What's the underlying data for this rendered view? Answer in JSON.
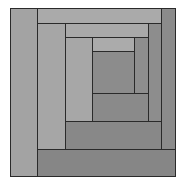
{
  "diagram": {
    "title": "",
    "type": "log-cabin-quilt-block",
    "rings": 3,
    "patches": [
      {
        "id": "ring1-left",
        "ring": 1,
        "side": "left",
        "color": "#a3a3a3"
      },
      {
        "id": "ring1-top",
        "ring": 1,
        "side": "top",
        "color": "#aaaaaa"
      },
      {
        "id": "ring1-right",
        "ring": 1,
        "side": "right",
        "color": "#8b8b8b"
      },
      {
        "id": "ring1-bottom",
        "ring": 1,
        "side": "bottom",
        "color": "#868686"
      },
      {
        "id": "ring2-left",
        "ring": 2,
        "side": "left",
        "color": "#a6a6a6"
      },
      {
        "id": "ring2-top",
        "ring": 2,
        "side": "top",
        "color": "#a9a9a9"
      },
      {
        "id": "ring2-right",
        "ring": 2,
        "side": "right",
        "color": "#8d8d8d"
      },
      {
        "id": "ring2-bottom",
        "ring": 2,
        "side": "bottom",
        "color": "#888888"
      },
      {
        "id": "ring3-left",
        "ring": 3,
        "side": "left",
        "color": "#a7a7a7"
      },
      {
        "id": "ring3-top",
        "ring": 3,
        "side": "top",
        "color": "#ababab"
      },
      {
        "id": "ring3-right",
        "ring": 3,
        "side": "right",
        "color": "#8e8e8e"
      },
      {
        "id": "ring3-bottom",
        "ring": 3,
        "side": "bottom",
        "color": "#8a8a8a"
      },
      {
        "id": "center",
        "ring": 0,
        "side": "center",
        "color": "#8c8c8c"
      }
    ]
  }
}
